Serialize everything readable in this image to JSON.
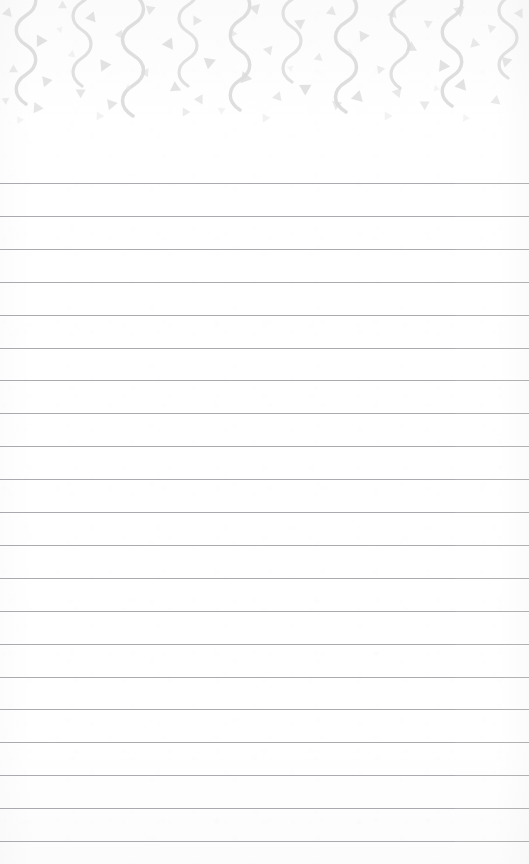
{
  "page": {
    "kind": "lined-notepad-page",
    "width": 529,
    "height": 864,
    "background_color": "#ffffff",
    "body_text": ""
  },
  "decoration": {
    "name": "confetti-and-streamers-border",
    "position": "top",
    "band_height": 132,
    "motif_color": "#dcdcdd",
    "motif_color_light": "#e6e6e7",
    "motifs": [
      {
        "icon": "streamer-squiggle-icon",
        "count": 10
      },
      {
        "icon": "confetti-triangle-icon",
        "count": 58
      }
    ],
    "streamers": [
      {
        "x": 26,
        "y": -14,
        "height": 118,
        "amplitude": 13,
        "stroke": 3.4,
        "opacity": 0.95
      },
      {
        "x": 82,
        "y": -26,
        "height": 112,
        "amplitude": 12,
        "stroke": 3.2,
        "opacity": 0.88
      },
      {
        "x": 133,
        "y": -6,
        "height": 122,
        "amplitude": 14,
        "stroke": 3.5,
        "opacity": 0.95
      },
      {
        "x": 188,
        "y": -22,
        "height": 108,
        "amplitude": 12,
        "stroke": 3.1,
        "opacity": 0.85
      },
      {
        "x": 240,
        "y": -10,
        "height": 120,
        "amplitude": 13,
        "stroke": 3.4,
        "opacity": 0.93
      },
      {
        "x": 292,
        "y": -28,
        "height": 110,
        "amplitude": 12,
        "stroke": 3.2,
        "opacity": 0.86
      },
      {
        "x": 346,
        "y": -8,
        "height": 120,
        "amplitude": 14,
        "stroke": 3.5,
        "opacity": 0.95
      },
      {
        "x": 400,
        "y": -24,
        "height": 112,
        "amplitude": 12,
        "stroke": 3.2,
        "opacity": 0.88
      },
      {
        "x": 452,
        "y": -12,
        "height": 118,
        "amplitude": 13,
        "stroke": 3.4,
        "opacity": 0.93
      },
      {
        "x": 508,
        "y": -30,
        "height": 108,
        "amplitude": 12,
        "stroke": 3.2,
        "opacity": 0.85
      }
    ],
    "triangles": [
      {
        "x": 8,
        "y": 12,
        "size": 9,
        "rot": 18,
        "opacity": 0.7
      },
      {
        "x": 40,
        "y": 40,
        "size": 11,
        "rot": -30,
        "opacity": 0.85
      },
      {
        "x": 14,
        "y": 70,
        "size": 8,
        "rot": 120,
        "opacity": 0.62
      },
      {
        "x": 46,
        "y": 82,
        "size": 10,
        "rot": 200,
        "opacity": 0.78
      },
      {
        "x": 6,
        "y": 100,
        "size": 7,
        "rot": 55,
        "opacity": 0.55
      },
      {
        "x": 62,
        "y": 6,
        "size": 8,
        "rot": 240,
        "opacity": 0.6
      },
      {
        "x": 38,
        "y": 108,
        "size": 10,
        "rot": 95,
        "opacity": 0.72
      },
      {
        "x": 92,
        "y": 18,
        "size": 10,
        "rot": 140,
        "opacity": 0.8
      },
      {
        "x": 72,
        "y": 54,
        "size": 7,
        "rot": 12,
        "opacity": 0.52
      },
      {
        "x": 104,
        "y": 66,
        "size": 11,
        "rot": 205,
        "opacity": 0.84
      },
      {
        "x": 80,
        "y": 92,
        "size": 9,
        "rot": 300,
        "opacity": 0.68
      },
      {
        "x": 112,
        "y": 104,
        "size": 10,
        "rot": 80,
        "opacity": 0.74
      },
      {
        "x": 60,
        "y": 30,
        "size": 6,
        "rot": 160,
        "opacity": 0.45
      },
      {
        "x": 120,
        "y": 34,
        "size": 8,
        "rot": 25,
        "opacity": 0.62
      },
      {
        "x": 150,
        "y": 10,
        "size": 9,
        "rot": 190,
        "opacity": 0.72
      },
      {
        "x": 168,
        "y": 44,
        "size": 11,
        "rot": 265,
        "opacity": 0.86
      },
      {
        "x": 146,
        "y": 72,
        "size": 8,
        "rot": 35,
        "opacity": 0.6
      },
      {
        "x": 176,
        "y": 88,
        "size": 10,
        "rot": 115,
        "opacity": 0.76
      },
      {
        "x": 196,
        "y": 20,
        "size": 9,
        "rot": 330,
        "opacity": 0.68
      },
      {
        "x": 210,
        "y": 62,
        "size": 11,
        "rot": 70,
        "opacity": 0.84
      },
      {
        "x": 200,
        "y": 100,
        "size": 9,
        "rot": 150,
        "opacity": 0.66
      },
      {
        "x": 232,
        "y": 34,
        "size": 8,
        "rot": 215,
        "opacity": 0.58
      },
      {
        "x": 256,
        "y": 8,
        "size": 10,
        "rot": 45,
        "opacity": 0.74
      },
      {
        "x": 268,
        "y": 50,
        "size": 9,
        "rot": 280,
        "opacity": 0.66
      },
      {
        "x": 246,
        "y": 78,
        "size": 11,
        "rot": 100,
        "opacity": 0.84
      },
      {
        "x": 278,
        "y": 96,
        "size": 9,
        "rot": 20,
        "opacity": 0.64
      },
      {
        "x": 300,
        "y": 24,
        "size": 10,
        "rot": 175,
        "opacity": 0.76
      },
      {
        "x": 318,
        "y": 58,
        "size": 8,
        "rot": 250,
        "opacity": 0.58
      },
      {
        "x": 306,
        "y": 88,
        "size": 11,
        "rot": 60,
        "opacity": 0.82
      },
      {
        "x": 332,
        "y": 12,
        "size": 9,
        "rot": 130,
        "opacity": 0.68
      },
      {
        "x": 336,
        "y": 104,
        "size": 9,
        "rot": 310,
        "opacity": 0.62
      },
      {
        "x": 364,
        "y": 36,
        "size": 10,
        "rot": 85,
        "opacity": 0.78
      },
      {
        "x": 380,
        "y": 70,
        "size": 8,
        "rot": 200,
        "opacity": 0.56
      },
      {
        "x": 358,
        "y": 96,
        "size": 11,
        "rot": 15,
        "opacity": 0.8
      },
      {
        "x": 392,
        "y": 14,
        "size": 9,
        "rot": 260,
        "opacity": 0.66
      },
      {
        "x": 412,
        "y": 48,
        "size": 10,
        "rot": 120,
        "opacity": 0.78
      },
      {
        "x": 398,
        "y": 92,
        "size": 9,
        "rot": 40,
        "opacity": 0.64
      },
      {
        "x": 428,
        "y": 24,
        "size": 8,
        "rot": 185,
        "opacity": 0.56
      },
      {
        "x": 444,
        "y": 66,
        "size": 11,
        "rot": 95,
        "opacity": 0.84
      },
      {
        "x": 424,
        "y": 104,
        "size": 9,
        "rot": 300,
        "opacity": 0.62
      },
      {
        "x": 460,
        "y": 10,
        "size": 10,
        "rot": 50,
        "opacity": 0.72
      },
      {
        "x": 474,
        "y": 44,
        "size": 9,
        "rot": 225,
        "opacity": 0.64
      },
      {
        "x": 462,
        "y": 86,
        "size": 11,
        "rot": 140,
        "opacity": 0.82
      },
      {
        "x": 492,
        "y": 28,
        "size": 8,
        "rot": 75,
        "opacity": 0.56
      },
      {
        "x": 506,
        "y": 62,
        "size": 10,
        "rot": 195,
        "opacity": 0.74
      },
      {
        "x": 496,
        "y": 100,
        "size": 9,
        "rot": 10,
        "opacity": 0.62
      },
      {
        "x": 520,
        "y": 14,
        "size": 9,
        "rot": 150,
        "opacity": 0.66
      },
      {
        "x": 128,
        "y": 88,
        "size": 6,
        "rot": 230,
        "opacity": 0.42
      },
      {
        "x": 222,
        "y": 110,
        "size": 7,
        "rot": 65,
        "opacity": 0.48
      },
      {
        "x": 290,
        "y": 68,
        "size": 6,
        "rot": 290,
        "opacity": 0.4
      },
      {
        "x": 350,
        "y": 52,
        "size": 6,
        "rot": 110,
        "opacity": 0.42
      },
      {
        "x": 436,
        "y": 88,
        "size": 6,
        "rot": 340,
        "opacity": 0.4
      },
      {
        "x": 186,
        "y": 112,
        "size": 8,
        "rot": 90,
        "opacity": 0.55
      },
      {
        "x": 100,
        "y": 116,
        "size": 8,
        "rot": 92,
        "opacity": 0.52
      },
      {
        "x": 266,
        "y": 118,
        "size": 8,
        "rot": 88,
        "opacity": 0.5
      },
      {
        "x": 388,
        "y": 116,
        "size": 8,
        "rot": 90,
        "opacity": 0.5
      },
      {
        "x": 466,
        "y": 118,
        "size": 7,
        "rot": 94,
        "opacity": 0.46
      },
      {
        "x": 20,
        "y": 120,
        "size": 7,
        "rot": 86,
        "opacity": 0.44
      }
    ]
  },
  "ruling": {
    "name": "horizontal-rule-lines",
    "line_color": "#9c9ca0",
    "line_count": 21,
    "first_line_y": 183,
    "spacing": 32.9,
    "line_thickness": 1,
    "left_inset": 0,
    "right_inset": 0
  }
}
